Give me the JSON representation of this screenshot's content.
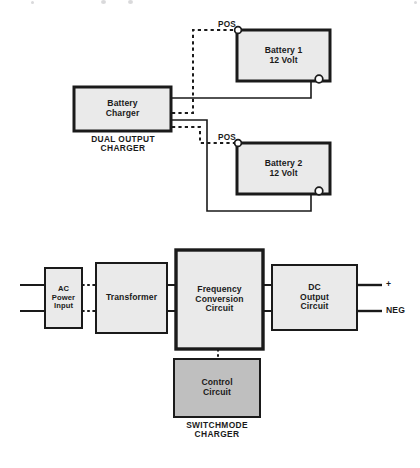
{
  "page": {
    "background_color": "#ffffff",
    "ink_color": "#1a1a1a",
    "box_fill_light": "#eaeaea",
    "box_fill_dark": "#bfbfbf"
  },
  "top_diagram": {
    "caption": "DUAL OUTPUT\nCHARGER",
    "charger": {
      "label": "Battery\nCharger"
    },
    "batteries": [
      {
        "label": "Battery 1\n12 Volt",
        "positive_terminal_label": "POS"
      },
      {
        "label": "Battery 2\n12 Volt",
        "positive_terminal_label": "POS"
      }
    ]
  },
  "bottom_diagram": {
    "caption": "SWITCHMODE\nCHARGER",
    "blocks": [
      {
        "label": "AC\nPower\nInput"
      },
      {
        "label": "Transformer"
      },
      {
        "label": "Frequency\nConversion\nCircuit"
      },
      {
        "label": "DC\nOutput\nCircuit"
      },
      {
        "label": "Control\nCircuit"
      }
    ],
    "output_terminals": [
      {
        "label": "+"
      },
      {
        "label": "NEG"
      }
    ]
  }
}
